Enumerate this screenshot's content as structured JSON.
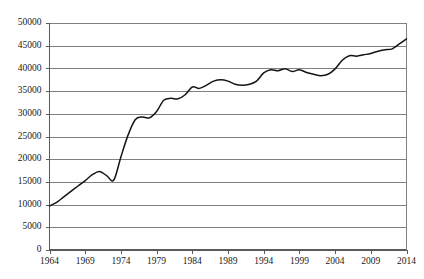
{
  "chart_data": {
    "type": "line",
    "title": "",
    "subtitle": "",
    "xlabel": "",
    "ylabel": "",
    "grid": true,
    "legend": false,
    "legend_position": "none",
    "xlim": [
      1964,
      2014
    ],
    "ylim": [
      0,
      50000
    ],
    "y_tick_labels": [
      "0",
      "5000",
      "10000",
      "15000",
      "20000",
      "25000",
      "30000",
      "35000",
      "40000",
      "45000",
      "50000"
    ],
    "y_ticks": [
      0,
      5000,
      10000,
      15000,
      20000,
      25000,
      30000,
      35000,
      40000,
      45000,
      50000
    ],
    "x_tick_labels": [
      "1964",
      "1969",
      "1974",
      "1979",
      "1984",
      "1989",
      "1994",
      "1999",
      "2004",
      "2009",
      "2014"
    ],
    "x_ticks": [
      1964,
      1969,
      1974,
      1979,
      1984,
      1989,
      1994,
      1999,
      2004,
      2009,
      2014
    ],
    "series": [
      {
        "name": "series-1",
        "color": "#141414",
        "x": [
          1964,
          1965,
          1966,
          1967,
          1968,
          1969,
          1970,
          1971,
          1972,
          1973,
          1974,
          1975,
          1976,
          1977,
          1978,
          1979,
          1980,
          1981,
          1982,
          1983,
          1984,
          1985,
          1986,
          1987,
          1988,
          1989,
          1990,
          1991,
          1992,
          1993,
          1994,
          1995,
          1996,
          1997,
          1998,
          1999,
          2000,
          2001,
          2002,
          2003,
          2004,
          2005,
          2006,
          2007,
          2008,
          2009,
          2010,
          2011,
          2012,
          2013,
          2014
        ],
        "values": [
          9700,
          10500,
          11700,
          12900,
          14100,
          15300,
          16600,
          17300,
          16400,
          15400,
          20500,
          25300,
          28700,
          29300,
          29100,
          30500,
          33000,
          33400,
          33300,
          34200,
          35900,
          35600,
          36300,
          37200,
          37500,
          37200,
          36500,
          36300,
          36500,
          37200,
          39000,
          39700,
          39500,
          39900,
          39300,
          39700,
          39100,
          38700,
          38400,
          38700,
          39900,
          41800,
          42800,
          42700,
          43000,
          43300,
          43800,
          44100,
          44300,
          45400,
          46500
        ]
      }
    ]
  }
}
